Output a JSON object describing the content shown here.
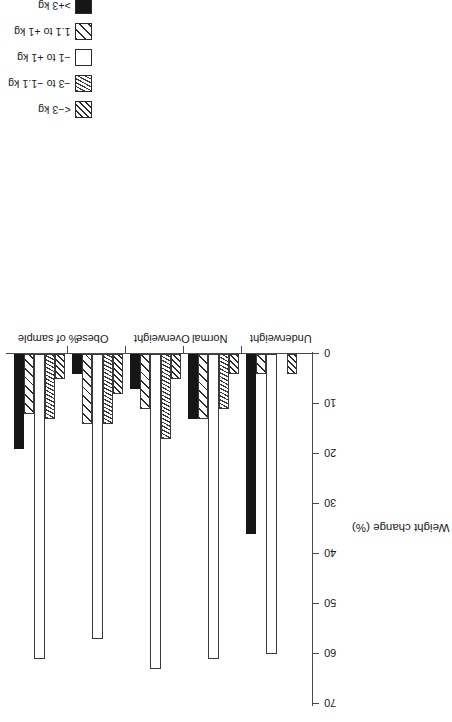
{
  "chart_data": {
    "type": "bar",
    "orientation": "horizontal-rotated",
    "title": "",
    "xlabel": "",
    "ylabel": "Weight change (%)",
    "categories": [
      "Underweight",
      "Normal",
      "Overweight",
      "Obese",
      "% of sample"
    ],
    "axis_ticks": [
      0,
      10,
      20,
      30,
      40,
      50,
      60,
      70
    ],
    "ylim": [
      0,
      70
    ],
    "grid": false,
    "legend_position": "top-left",
    "series": [
      {
        "name": "<−3 kg",
        "pattern": "dense-diagonal-hatch",
        "values": [
          4,
          4,
          5,
          8,
          5
        ]
      },
      {
        "name": "−3 to −1.1 kg",
        "pattern": "dashed-scatter",
        "values": [
          0,
          11,
          17,
          14,
          13
        ]
      },
      {
        "name": "−1 to +1 kg",
        "pattern": "white",
        "values": [
          60,
          61,
          63,
          57,
          61
        ]
      },
      {
        "name": "1.1 to +1 kg",
        "pattern": "sparse-diagonal-hatch",
        "values": [
          4,
          13,
          11,
          14,
          12
        ]
      },
      {
        "name": ">+3 kg",
        "pattern": "solid-black",
        "values": [
          36,
          13,
          7,
          4,
          19
        ]
      }
    ],
    "colors": {
      "ink": "#1a1a1a",
      "axis": "#4a4a4a",
      "bar_outline": "#3a3a3a",
      "solid_fill": "#161616",
      "background": "#ffffff"
    }
  },
  "legend": {
    "items": [
      {
        "label": "<−3 kg",
        "swatch": "dense-diagonal-hatch-swatch"
      },
      {
        "label": "−3 to −1.1 kg",
        "swatch": "dashed-scatter-swatch"
      },
      {
        "label": "−1 to +1 kg",
        "swatch": "white-swatch"
      },
      {
        "label": "1.1 to +1 kg",
        "swatch": "sparse-diagonal-hatch-swatch"
      },
      {
        "label": ">+3 kg",
        "swatch": "solid-black-swatch"
      }
    ]
  },
  "axis": {
    "title": "Weight change (%)",
    "ticks": [
      "70",
      "60",
      "50",
      "40",
      "30",
      "20",
      "10",
      "0"
    ]
  },
  "categories": {
    "labels": [
      "% of sample",
      "Obese",
      "Overweight",
      "Normal",
      "Underweight"
    ]
  }
}
